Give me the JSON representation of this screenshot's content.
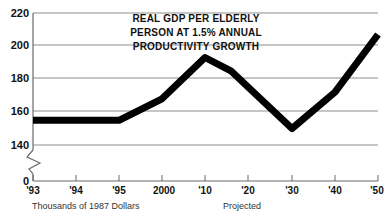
{
  "chart_data": {
    "type": "line",
    "title": "REAL GDP PER ELDERLY PERSON AT 1.5% ANNUAL PRODUCTIVITY GROWTH",
    "title_lines": [
      "REAL GDP PER ELDERLY",
      "PERSON AT 1.5% ANNUAL",
      "PRODUCTIVITY GROWTH"
    ],
    "xlabel": "",
    "ylabel": "",
    "y_axis_note": "Thousands of 1987 Dollars",
    "projected_note": "Projected",
    "ylim": [
      0,
      220
    ],
    "y_ticks": [
      220,
      200,
      180,
      160,
      140,
      0
    ],
    "y_tick_labels": [
      "220",
      "200",
      "180",
      "160",
      "140",
      "0"
    ],
    "axis_break": true,
    "axis_break_between": [
      140,
      0
    ],
    "grid": true,
    "legend": "none",
    "x_ticks": [
      1993,
      1994,
      1995,
      2000,
      2010,
      2020,
      2030,
      2040,
      2050
    ],
    "x_tick_labels": [
      "'93",
      "'94",
      "'95",
      "2000",
      "'10",
      "'20",
      "'30",
      "'40",
      "'50"
    ],
    "x": [
      1993,
      1994,
      1995,
      2000,
      2010,
      2016,
      2030,
      2040,
      2050
    ],
    "values": [
      155,
      155,
      155,
      168,
      193,
      185,
      150,
      172,
      207
    ],
    "series": [
      {
        "name": "Real GDP per elderly person",
        "x": [
          1993,
          1994,
          1995,
          2000,
          2010,
          2016,
          2030,
          2040,
          2050
        ],
        "values": [
          155,
          155,
          155,
          168,
          193,
          185,
          150,
          172,
          207
        ],
        "color": "#000000"
      }
    ],
    "colors": {
      "series": "#000000",
      "grid": "#8d8d8d",
      "axis": "#6b6b6b",
      "text": "#111111",
      "background": "#ffffff"
    }
  }
}
